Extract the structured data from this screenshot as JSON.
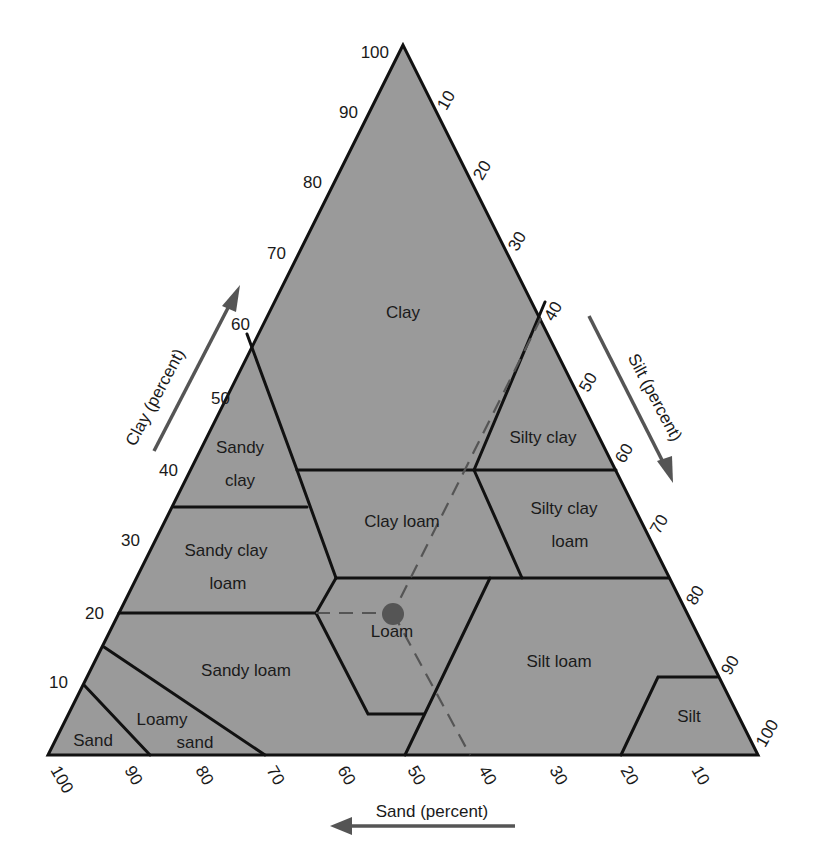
{
  "colors": {
    "fill": "#9a9a9a",
    "line": "#111111",
    "dashed": "#555555",
    "arrow": "#555555",
    "text": "#1a1a1a",
    "dot": "#555555"
  },
  "axes": {
    "clay": {
      "title": "Clay   (percent)",
      "ticks": [
        "10",
        "20",
        "30",
        "40",
        "50",
        "60",
        "70",
        "80",
        "90",
        "100"
      ]
    },
    "silt": {
      "title": "Silt   (percent)",
      "ticks": [
        "10",
        "20",
        "30",
        "40",
        "50",
        "60",
        "70",
        "80",
        "90",
        "100"
      ]
    },
    "sand": {
      "title": "Sand  (percent)",
      "ticks": [
        "100",
        "90",
        "80",
        "70",
        "60",
        "50",
        "40",
        "30",
        "20",
        "10"
      ]
    }
  },
  "regions": [
    {
      "name": "Clay",
      "lines": [
        "Clay"
      ]
    },
    {
      "name": "Sandy clay",
      "lines": [
        "Sandy",
        "clay"
      ]
    },
    {
      "name": "Silty clay",
      "lines": [
        "Silty clay"
      ]
    },
    {
      "name": "Clay loam",
      "lines": [
        "Clay loam"
      ]
    },
    {
      "name": "Silty clay loam",
      "lines": [
        "Silty clay",
        "loam"
      ]
    },
    {
      "name": "Sandy clay loam",
      "lines": [
        "Sandy  clay",
        "loam"
      ]
    },
    {
      "name": "Loam",
      "lines": [
        "Loam"
      ]
    },
    {
      "name": "Silt loam",
      "lines": [
        "Silt loam"
      ]
    },
    {
      "name": "Sandy loam",
      "lines": [
        "Sandy loam"
      ]
    },
    {
      "name": "Loamy sand",
      "lines": [
        "Loamy",
        "sand"
      ]
    },
    {
      "name": "Sand",
      "lines": [
        "Sand"
      ]
    },
    {
      "name": "Silt",
      "lines": [
        "Silt"
      ]
    }
  ],
  "example_point": {
    "clay": 20,
    "silt": 40,
    "sand": 40,
    "class": "Loam"
  }
}
